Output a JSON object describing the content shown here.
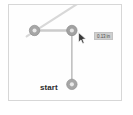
{
  "widget": {
    "name": "path-measure-canvas",
    "background": "#fefefe",
    "frame_border": "#d7d7d7"
  },
  "labels": {
    "start": "start"
  },
  "measurement": {
    "value": "0.13 in",
    "badge_bg": "#cfcfcf",
    "badge_text": "#4a4a4a"
  },
  "nodes": [
    {
      "id": "node-left",
      "label": "1",
      "cx": 26,
      "cy": 26,
      "r": 5.5,
      "fill": "#a6a6a6",
      "stroke": "#8e8e8e"
    },
    {
      "id": "node-corner",
      "label": "2",
      "cx": 64,
      "cy": 26,
      "r": 5.5,
      "fill": "#a1a1a1",
      "stroke": "#8a8a8a"
    },
    {
      "id": "node-start",
      "label": "3",
      "cx": 64,
      "cy": 81,
      "r": 5.5,
      "fill": "#a6a6a6",
      "stroke": "#8e8e8e"
    }
  ],
  "segments": [
    {
      "id": "segment-horizontal",
      "x1": 26,
      "y1": 26,
      "x2": 64,
      "y2": 26,
      "color": "#cccccc",
      "width": 2.4
    },
    {
      "id": "segment-vertical",
      "x1": 64,
      "y1": 26,
      "x2": 64,
      "y2": 81,
      "color": "#b0b0b0",
      "width": 1.3
    }
  ],
  "guide_line": {
    "id": "guide-diagonal",
    "x1": 18,
    "y1": 32,
    "x2": 74,
    "y2": -4,
    "color": "#d8d8d8",
    "width": 2.2
  },
  "cursor": {
    "name": "mouse-pointer",
    "x": 69,
    "y": 27,
    "fill": "#3a3a3a",
    "stroke": "#ffffff"
  }
}
